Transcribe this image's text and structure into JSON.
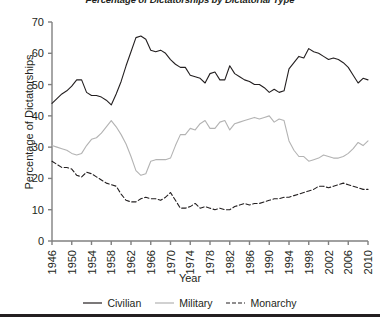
{
  "chart_data": {
    "type": "line",
    "title": "Percentage of Dictatorships by Dictatorial Type",
    "xlabel": "Year",
    "ylabel": "Percentage of Dictatorships",
    "xlim": [
      1946,
      2010
    ],
    "ylim": [
      0,
      70
    ],
    "ytick_step": 10,
    "xtick_step": 4,
    "grid": false,
    "legend_position": "bottom-center",
    "yticks": [
      "0",
      "10",
      "20",
      "30",
      "40",
      "50",
      "60",
      "70"
    ],
    "xticks": [
      "1946",
      "1950",
      "1954",
      "1958",
      "1962",
      "1966",
      "1970",
      "1974",
      "1978",
      "1982",
      "1986",
      "1990",
      "1994",
      "1998",
      "2002",
      "2006",
      "2010"
    ],
    "colors": {
      "civilian": "#231f20",
      "military": "#b3b3b3",
      "monarchy": "#231f20",
      "axis": "#808080",
      "text": "#231f20"
    },
    "x": [
      1946,
      1947,
      1948,
      1949,
      1950,
      1951,
      1952,
      1953,
      1954,
      1955,
      1956,
      1957,
      1958,
      1959,
      1960,
      1961,
      1962,
      1963,
      1964,
      1965,
      1966,
      1967,
      1968,
      1969,
      1970,
      1971,
      1972,
      1973,
      1974,
      1975,
      1976,
      1977,
      1978,
      1979,
      1980,
      1981,
      1982,
      1983,
      1984,
      1985,
      1986,
      1987,
      1988,
      1989,
      1990,
      1991,
      1992,
      1993,
      1994,
      1995,
      1996,
      1997,
      1998,
      1999,
      2000,
      2001,
      2002,
      2003,
      2004,
      2005,
      2006,
      2007,
      2008,
      2009,
      2010
    ],
    "series": [
      {
        "name": "Civilian",
        "style": "solid",
        "color": "#231f20",
        "values": [
          44,
          45.5,
          47,
          48,
          49.5,
          51.5,
          51.5,
          47.5,
          46.5,
          46.5,
          46,
          45,
          43.5,
          47,
          51,
          56,
          60.5,
          65,
          65.5,
          64.5,
          61,
          60.5,
          61,
          60,
          58,
          56.5,
          55.5,
          55.5,
          53,
          52.5,
          52,
          50.5,
          53.5,
          54,
          51.5,
          51.5,
          56,
          53.5,
          52.5,
          51.5,
          51,
          50,
          50,
          49,
          47.5,
          48.5,
          47.5,
          48,
          55,
          57,
          59,
          58.5,
          61.5,
          60.5,
          60,
          59,
          58,
          58.5,
          58,
          57,
          55.5,
          53,
          50.5,
          52,
          51.5
        ]
      },
      {
        "name": "Military",
        "style": "solid",
        "color": "#b3b3b3",
        "values": [
          30.5,
          30,
          29.5,
          29,
          28,
          27.5,
          28,
          30.5,
          32.5,
          33,
          34.5,
          36.5,
          38.5,
          36.5,
          34,
          31,
          27,
          22.5,
          21,
          21.5,
          25.5,
          26,
          26,
          26,
          26.5,
          30.5,
          34,
          34,
          36,
          35.5,
          37.5,
          38.5,
          36,
          36,
          38,
          38.5,
          35.5,
          37.5,
          38,
          38.5,
          39,
          39.5,
          39,
          39.5,
          40,
          38,
          39,
          38.5,
          32,
          29,
          27,
          27,
          25.5,
          26,
          26.5,
          27.5,
          27,
          26.5,
          26.5,
          27,
          28,
          29.5,
          31.5,
          30.5,
          32
        ]
      },
      {
        "name": "Monarchy",
        "style": "dashed",
        "color": "#231f20",
        "values": [
          25.5,
          24.5,
          23.5,
          23.5,
          23,
          21,
          20.5,
          22,
          21.5,
          20.5,
          19.5,
          18.5,
          18,
          17.5,
          15,
          13,
          12.5,
          12.5,
          13.5,
          14,
          13.5,
          13.5,
          13,
          14,
          15.5,
          13,
          10.5,
          10.5,
          11,
          12,
          10.5,
          11,
          10.5,
          10,
          10.5,
          10,
          10,
          11,
          11.5,
          12,
          11.5,
          12,
          12,
          12.5,
          13,
          13.5,
          13.5,
          14,
          14,
          14.5,
          15,
          15.5,
          16,
          16.5,
          17.5,
          17.5,
          17,
          17.5,
          18,
          18.5,
          18,
          17.5,
          17,
          16.5,
          16.5
        ]
      }
    ]
  },
  "legend": {
    "items": [
      {
        "label": "Civilian"
      },
      {
        "label": "Military"
      },
      {
        "label": "Monarchy"
      }
    ]
  }
}
